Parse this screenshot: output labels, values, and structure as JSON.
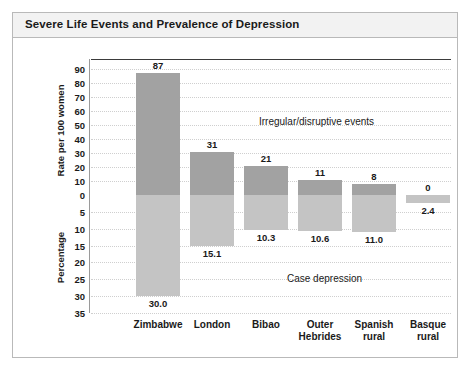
{
  "title": "Severe Life Events and Prevalence of Depression",
  "axes": {
    "upper_title": "Rate per 100 women",
    "lower_title": "Percentage",
    "upper_ticks": [
      "90",
      "80",
      "70",
      "60",
      "50",
      "40",
      "30",
      "20",
      "10",
      "0"
    ],
    "lower_ticks": [
      "5",
      "10",
      "15",
      "20",
      "25",
      "30",
      "35"
    ]
  },
  "annotations": {
    "upper": "Irregular/disruptive events",
    "lower": "Case depression"
  },
  "colors": {
    "bar_upper": "#a2a2a2",
    "bar_lower": "#c4c4c4",
    "zero_line": "#3b3b3b",
    "grid": "#cfcfcf",
    "frame": "#b9b9b9",
    "title_bg": "#f2f2f2",
    "text": "#1a1a1a"
  },
  "chart_data": {
    "type": "bar",
    "title": "Severe Life Events and Prevalence of Depression",
    "xlabel": "",
    "ylabel": "Rate per 100 women / Percentage",
    "categories": [
      "Zimbabwe",
      "London",
      "Bibao",
      "Outer Hebrides",
      "Spanish rural",
      "Basque rural"
    ],
    "category_lines": [
      [
        "Zimbabwe"
      ],
      [
        "London"
      ],
      [
        "Bibao"
      ],
      [
        "Outer",
        "Hebrides"
      ],
      [
        "Spanish",
        "rural"
      ],
      [
        "Basque",
        "rural"
      ]
    ],
    "series": [
      {
        "name": "Irregular/disruptive events",
        "axis": "upper",
        "unit": "Rate per 100 women",
        "values": [
          87,
          31,
          21,
          11,
          8,
          0
        ],
        "labels": [
          "87",
          "31",
          "21",
          "11",
          "8",
          "0"
        ],
        "ylim": [
          0,
          90
        ]
      },
      {
        "name": "Case depression",
        "axis": "lower",
        "unit": "Percentage",
        "values": [
          30.0,
          15.1,
          10.3,
          10.6,
          11.0,
          2.4
        ],
        "labels": [
          "30.0",
          "15.1",
          "10.3",
          "10.6",
          "11.0",
          "2.4"
        ],
        "ylim": [
          0,
          35
        ]
      }
    ],
    "grid": true,
    "legend": "none"
  }
}
